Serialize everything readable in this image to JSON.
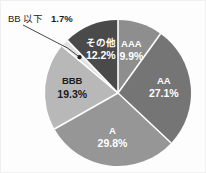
{
  "chart_data": {
    "type": "pie",
    "title": "",
    "subtitle": "",
    "xlabel": "",
    "ylabel": "",
    "legend_position": "none",
    "grid": false,
    "units": "percent",
    "total": 100.0,
    "start_angle_deg": 0,
    "direction": "clockwise",
    "categories": [
      "AAA",
      "AA",
      "A",
      "BBB",
      "BB 以下",
      "その他"
    ],
    "values": [
      9.9,
      27.1,
      29.8,
      19.3,
      1.7,
      12.2
    ],
    "value_labels": [
      "9.9%",
      "27.1%",
      "29.8%",
      "19.3%",
      "1.7%",
      "12.2%"
    ],
    "colors": [
      "#8e8e8e",
      "#757575",
      "#969696",
      "#b8b8b8",
      "#e2e2e2",
      "#4a4a4a"
    ],
    "slices": [
      {
        "name": "AAA",
        "value": 9.9,
        "value_label": "9.9%",
        "color": "#8e8e8e",
        "label_style": "inside",
        "text_color": "light"
      },
      {
        "name": "AA",
        "value": 27.1,
        "value_label": "27.1%",
        "color": "#757575",
        "label_style": "inside",
        "text_color": "light"
      },
      {
        "name": "A",
        "value": 29.8,
        "value_label": "29.8%",
        "color": "#969696",
        "label_style": "inside",
        "text_color": "light"
      },
      {
        "name": "BBB",
        "value": 19.3,
        "value_label": "19.3%",
        "color": "#b8b8b8",
        "label_style": "inside",
        "text_color": "dark"
      },
      {
        "name": "BB 以下",
        "value": 1.7,
        "value_label": "1.7%",
        "color": "#e2e2e2",
        "label_style": "callout",
        "text_color": "dark"
      },
      {
        "name": "その他",
        "value": 12.2,
        "value_label": "12.2%",
        "color": "#4a4a4a",
        "label_style": "inside",
        "text_color": "light"
      }
    ]
  },
  "callout": {
    "name": "BB 以下",
    "value_label": "1.7%"
  }
}
